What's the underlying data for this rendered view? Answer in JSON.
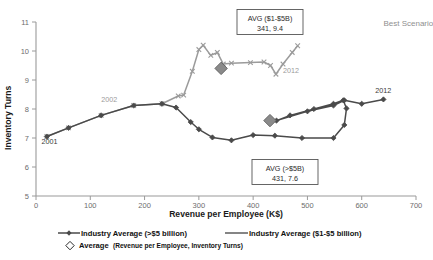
{
  "chart_data": {
    "type": "line",
    "title": "",
    "xlabel": "Revenue per Employee (K$)",
    "ylabel": "Inventory Turns",
    "xlim": [
      0,
      700
    ],
    "ylim": [
      5,
      11
    ],
    "xticks": [
      0,
      100,
      200,
      300,
      400,
      500,
      600,
      700
    ],
    "yticks": [
      5,
      6,
      7,
      8,
      9,
      10,
      11
    ],
    "grid": false,
    "legend_position": "bottom",
    "annotations": [
      {
        "name": "scenario-note",
        "text": "Best Scenario",
        "x": 640,
        "y": 10.85
      },
      {
        "name": "year-start-light",
        "text": "2002",
        "x": 120,
        "y": 8.25
      },
      {
        "name": "year-end-light",
        "text": "2012",
        "x": 455,
        "y": 9.25
      },
      {
        "name": "year-start-dark",
        "text": "2001",
        "x": 10,
        "y": 6.78
      },
      {
        "name": "year-end-dark",
        "text": "2012",
        "x": 625,
        "y": 8.55
      }
    ],
    "callouts": [
      {
        "name": "avg-1-5b-callout",
        "line1": "AVG ($1-$5B)",
        "line2": "341, 9.4",
        "x": 341,
        "y": 9.4
      },
      {
        "name": "avg-over-5b-callout",
        "line1": "AVG (>$5B)",
        "line2": "431, 7.6",
        "x": 431,
        "y": 7.6
      }
    ],
    "series": [
      {
        "name": "Industry Average ($1-$5 billion)",
        "color": "#9b9b9b",
        "marker": "x",
        "points": [
          [
            20,
            7.05
          ],
          [
            60,
            7.35
          ],
          [
            120,
            7.78
          ],
          [
            180,
            8.12
          ],
          [
            232,
            8.18
          ],
          [
            262,
            8.45
          ],
          [
            272,
            8.48
          ],
          [
            288,
            9.3
          ],
          [
            300,
            10.05
          ],
          [
            308,
            10.2
          ],
          [
            322,
            9.85
          ],
          [
            334,
            9.95
          ],
          [
            345,
            9.55
          ],
          [
            360,
            9.58
          ],
          [
            395,
            9.6
          ],
          [
            420,
            9.62
          ],
          [
            432,
            9.5
          ],
          [
            442,
            9.2
          ],
          [
            455,
            9.55
          ],
          [
            472,
            9.95
          ],
          [
            482,
            10.18
          ]
        ]
      },
      {
        "name": "Industry Average (>$5 billion)",
        "color": "#4a4a4a",
        "marker": "diamond",
        "points": [
          [
            20,
            7.05
          ],
          [
            60,
            7.35
          ],
          [
            120,
            7.78
          ],
          [
            180,
            8.12
          ],
          [
            232,
            8.18
          ],
          [
            258,
            8.05
          ],
          [
            285,
            7.55
          ],
          [
            300,
            7.3
          ],
          [
            325,
            7.02
          ],
          [
            360,
            6.92
          ],
          [
            400,
            7.1
          ],
          [
            440,
            7.08
          ],
          [
            490,
            7.0
          ],
          [
            548,
            7.0
          ],
          [
            568,
            7.45
          ],
          [
            572,
            8.02
          ],
          [
            566,
            8.3
          ],
          [
            548,
            8.18
          ],
          [
            512,
            8.0
          ],
          [
            468,
            7.78
          ],
          [
            443,
            7.6
          ],
          [
            500,
            7.92
          ],
          [
            548,
            8.12
          ],
          [
            568,
            8.3
          ],
          [
            600,
            8.18
          ],
          [
            640,
            8.33
          ]
        ]
      }
    ],
    "average_markers": [
      {
        "name": "avg-marker-1-5b",
        "x": 341,
        "y": 9.4
      },
      {
        "name": "avg-marker-over-5b",
        "x": 431,
        "y": 7.6
      }
    ]
  },
  "legend": {
    "items": [
      {
        "name": "legend-item-over-5b",
        "label": "Industry Average (>$5 billion)",
        "marker": "line-diamond",
        "color": "#4a4a4a"
      },
      {
        "name": "legend-item-1-5b",
        "label": "Industry Average ($1-$5 billion)",
        "marker": "line",
        "color": "#6f6f6f"
      },
      {
        "name": "legend-item-average",
        "label": "Average",
        "sublabel": "(Revenue per Employee, Inventory Turns)",
        "marker": "diamond-outline",
        "color": "#2a2a2a"
      }
    ]
  }
}
